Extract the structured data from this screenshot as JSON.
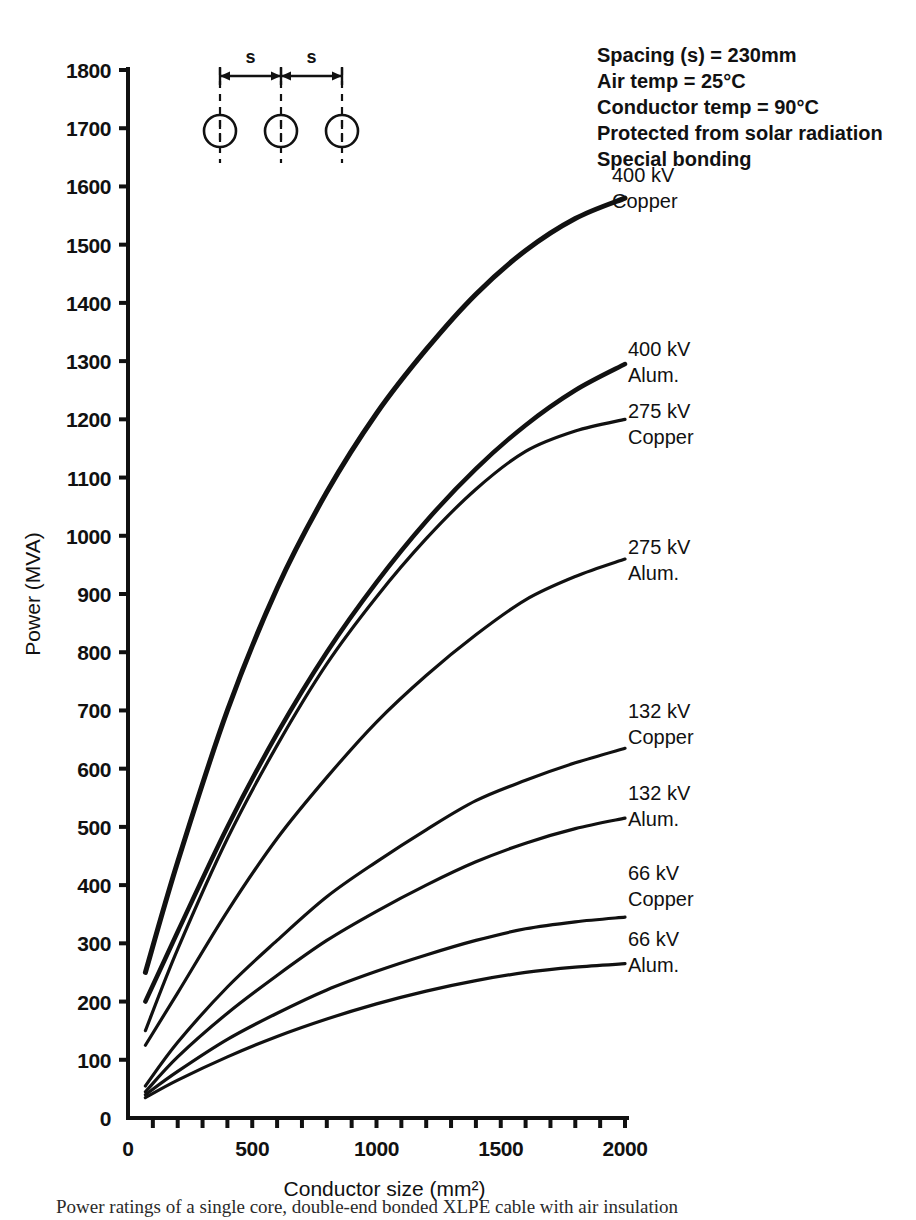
{
  "chart_data": {
    "type": "line",
    "title": "",
    "xlabel": "Conductor size (mm²)",
    "ylabel": "Power (MVA)",
    "xlim": [
      0,
      2000
    ],
    "ylim": [
      0,
      1800
    ],
    "xticks": [
      0,
      500,
      1000,
      1500,
      2000
    ],
    "xtick_labels": [
      "0",
      "500",
      "1000",
      "1500",
      "2000"
    ],
    "xminor_step": 100,
    "yticks": [
      0,
      100,
      200,
      300,
      400,
      500,
      600,
      700,
      800,
      900,
      1000,
      1100,
      1200,
      1300,
      1400,
      1500,
      1600,
      1700,
      1800
    ],
    "ytick_labels": [
      "0",
      "100",
      "200",
      "300",
      "400",
      "500",
      "600",
      "700",
      "800",
      "900",
      "1000",
      "1100",
      "1200",
      "1300",
      "1400",
      "1500",
      "1600",
      "1700",
      "1800"
    ],
    "grid": false,
    "legend_position": "inline-curve-labels",
    "series": [
      {
        "name": "400 kV Copper",
        "label_lines": [
          "400 kV",
          "Copper"
        ],
        "x": [
          70,
          200,
          400,
          600,
          800,
          1000,
          1200,
          1400,
          1600,
          1800,
          2000
        ],
        "y": [
          250,
          440,
          700,
          910,
          1075,
          1210,
          1320,
          1415,
          1490,
          1545,
          1580
        ]
      },
      {
        "name": "400 kV Alum.",
        "label_lines": [
          "400 kV",
          "Alum."
        ],
        "x": [
          70,
          200,
          400,
          600,
          800,
          1000,
          1200,
          1400,
          1600,
          1800,
          2000
        ],
        "y": [
          200,
          320,
          500,
          660,
          800,
          920,
          1025,
          1115,
          1190,
          1250,
          1295
        ]
      },
      {
        "name": "275 kV Copper",
        "label_lines": [
          "275 kV",
          "Copper"
        ],
        "x": [
          70,
          200,
          400,
          600,
          800,
          1000,
          1200,
          1400,
          1600,
          1800,
          2000
        ],
        "y": [
          150,
          290,
          480,
          640,
          780,
          895,
          995,
          1080,
          1145,
          1180,
          1200
        ]
      },
      {
        "name": "275 kV Alum.",
        "label_lines": [
          "275 kV",
          "Alum."
        ],
        "x": [
          70,
          200,
          400,
          600,
          800,
          1000,
          1200,
          1400,
          1600,
          1800,
          2000
        ],
        "y": [
          125,
          215,
          355,
          480,
          585,
          680,
          760,
          830,
          890,
          930,
          960
        ]
      },
      {
        "name": "132 kV Copper",
        "label_lines": [
          "132 kV",
          "Copper"
        ],
        "x": [
          70,
          200,
          400,
          600,
          800,
          1000,
          1200,
          1400,
          1600,
          1800,
          2000
        ],
        "y": [
          55,
          130,
          225,
          305,
          380,
          440,
          495,
          545,
          580,
          610,
          635
        ]
      },
      {
        "name": "132 kV Alum.",
        "label_lines": [
          "132 kV",
          "Alum."
        ],
        "x": [
          70,
          200,
          400,
          600,
          800,
          1000,
          1200,
          1400,
          1600,
          1800,
          2000
        ],
        "y": [
          45,
          105,
          180,
          245,
          305,
          355,
          400,
          440,
          472,
          497,
          515
        ]
      },
      {
        "name": "66 kV Copper",
        "label_lines": [
          "66 kV",
          "Copper"
        ],
        "x": [
          70,
          200,
          400,
          600,
          800,
          1000,
          1200,
          1400,
          1600,
          1800,
          2000
        ],
        "y": [
          40,
          80,
          135,
          180,
          220,
          252,
          280,
          305,
          325,
          337,
          345
        ]
      },
      {
        "name": "66 kV Alum.",
        "label_lines": [
          "66 kV",
          "Alum."
        ],
        "x": [
          70,
          200,
          400,
          600,
          800,
          1000,
          1200,
          1400,
          1600,
          1800,
          2000
        ],
        "y": [
          35,
          65,
          105,
          140,
          170,
          196,
          218,
          236,
          250,
          259,
          265
        ]
      }
    ]
  },
  "annotations": {
    "lines": [
      "Spacing (s) = 230mm",
      "Air temp = 25°C",
      "Conductor temp = 90°C",
      "Protected from solar radiation",
      "Special bonding"
    ]
  },
  "diagram": {
    "name": "three-conductor-spacing-diagram",
    "dimension_label_left": "s",
    "dimension_label_right": "s",
    "conductor_count": 3
  },
  "caption": {
    "text": "Power ratings of a single core, double-end bonded XLPE cable with air insulation"
  },
  "colors": {
    "line": "#111111",
    "text": "#111111",
    "background": "#ffffff"
  }
}
